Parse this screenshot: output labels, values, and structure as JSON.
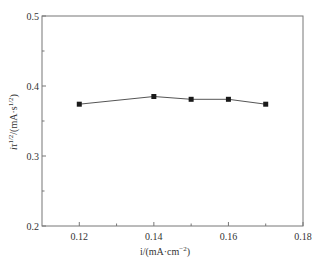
{
  "chart_data": {
    "type": "line",
    "title": "",
    "xlabel": "i/(mA·cm⁻²)",
    "xlabel_parts": {
      "main": "i/(mA·cm",
      "sup": "−2",
      "tail": ")"
    },
    "ylabel": "iτ^1/2/(mA·s^1/2)",
    "ylabel_parts": {
      "a": "iτ",
      "sup1": "1/2",
      "b": "/(mA·s",
      "sup2": "1/2",
      "c": ")"
    },
    "xlim": [
      0.11,
      0.18
    ],
    "ylim": [
      0.2,
      0.5
    ],
    "xticks": [
      0.12,
      0.14,
      0.16,
      0.18
    ],
    "xtick_labels": [
      "0.12",
      "0.14",
      "0.16",
      "0.18"
    ],
    "xminor_ticks": [
      0.13,
      0.15,
      0.17
    ],
    "yticks": [
      0.2,
      0.3,
      0.4,
      0.5
    ],
    "ytick_labels": [
      "0.2",
      "0.3",
      "0.4",
      "0.5"
    ],
    "yminor_ticks": [
      0.25,
      0.35,
      0.45
    ],
    "grid": false,
    "legend": null,
    "series": [
      {
        "name": "iτ^1/2",
        "marker": "square",
        "color": "#1a1a1a",
        "x": [
          0.12,
          0.14,
          0.15,
          0.16,
          0.17
        ],
        "y": [
          0.374,
          0.385,
          0.381,
          0.381,
          0.374
        ]
      }
    ]
  },
  "colors": {
    "axis": "#777777",
    "line": "#555555",
    "marker": "#1a1a1a",
    "text": "#333333"
  }
}
